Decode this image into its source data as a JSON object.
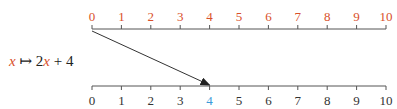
{
  "function_label": {
    "var": "x",
    "arrow": " ↦ 2",
    "var2": "x",
    "rest": " + 4"
  },
  "top_axis": {
    "ticks": [
      "0",
      "1",
      "2",
      "3",
      "4",
      "5",
      "6",
      "7",
      "8",
      "9",
      "10"
    ],
    "label_color": "#d9502a"
  },
  "bottom_axis": {
    "ticks": [
      "0",
      "1",
      "2",
      "3",
      "4",
      "5",
      "6",
      "7",
      "8",
      "9",
      "10"
    ],
    "label_color": "#333333",
    "highlight_index": 4,
    "highlight_color": "#3a9ad9"
  },
  "mapping_arrow": {
    "from": "0",
    "to": "4"
  }
}
